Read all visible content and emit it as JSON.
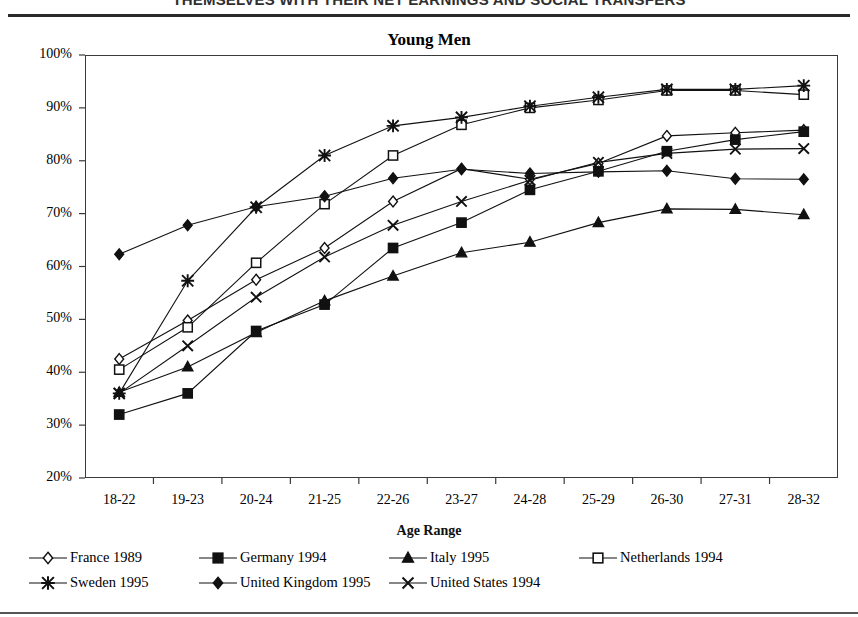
{
  "header": {
    "banner_text": "THEMSELVES WITH THEIR NET EARNINGS AND SOCIAL TRANSFERS"
  },
  "chart_data": {
    "type": "line",
    "title": "Young Men",
    "xlabel": "Age Range",
    "ylabel": "",
    "ylim": [
      20,
      100
    ],
    "ytick_labels": [
      "20%",
      "30%",
      "40%",
      "50%",
      "60%",
      "70%",
      "80%",
      "90%",
      "100%"
    ],
    "ytick_values": [
      20,
      30,
      40,
      50,
      60,
      70,
      80,
      90,
      100
    ],
    "grid": false,
    "legend_position": "bottom",
    "categories": [
      "18-22",
      "19-23",
      "20-24",
      "21-25",
      "22-26",
      "23-27",
      "24-28",
      "25-29",
      "26-30",
      "27-31",
      "28-32"
    ],
    "series": [
      {
        "name": "France 1989",
        "marker": "diamond-open",
        "values": [
          42.5,
          49.8,
          57.5,
          63.5,
          72.3,
          78.5,
          76.5,
          79.5,
          84.7,
          85.3,
          85.8
        ]
      },
      {
        "name": "Germany 1994",
        "marker": "square-filled",
        "values": [
          32.0,
          36.0,
          47.8,
          52.8,
          63.5,
          68.3,
          74.5,
          78.0,
          81.8,
          84.0,
          85.5
        ]
      },
      {
        "name": "Italy 1995",
        "marker": "triangle-filled",
        "values": [
          36.2,
          41.0,
          47.5,
          53.5,
          58.2,
          62.6,
          64.6,
          68.3,
          70.9,
          70.8,
          69.8
        ]
      },
      {
        "name": "Netherlands 1994",
        "marker": "square-open",
        "values": [
          40.5,
          48.5,
          60.7,
          71.8,
          81.0,
          86.8,
          90.0,
          91.5,
          93.3,
          93.3,
          92.5
        ]
      },
      {
        "name": "Sweden 1995",
        "marker": "asterisk",
        "values": [
          36.0,
          57.3,
          71.2,
          81.0,
          86.6,
          88.2,
          90.3,
          92.0,
          93.5,
          93.5,
          94.2
        ]
      },
      {
        "name": "United Kingdom 1995",
        "marker": "diamond-filled",
        "values": [
          62.3,
          67.8,
          71.3,
          73.3,
          76.7,
          78.4,
          77.6,
          77.9,
          78.1,
          76.6,
          76.5
        ]
      },
      {
        "name": "United States 1994",
        "marker": "cross",
        "values": [
          36.0,
          45.0,
          54.2,
          61.8,
          67.8,
          72.3,
          76.3,
          79.7,
          81.4,
          82.2,
          82.3
        ]
      }
    ]
  }
}
